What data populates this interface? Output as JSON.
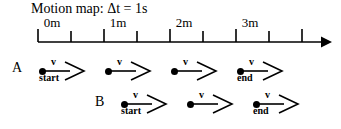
{
  "diagram": {
    "title": "Motion map: Δt = 1s",
    "axis": {
      "start_x": 38,
      "end_x": 332,
      "y": 42,
      "tick_spacing": 33,
      "tick_count": 9,
      "tick_height_major": 13,
      "tick_height_minor": 11,
      "arrowhead": "solid-right-triangle",
      "color": "#000000"
    },
    "tick_labels": [
      {
        "text": "0m",
        "x": 52
      },
      {
        "text": "1m",
        "x": 118
      },
      {
        "text": "2m",
        "x": 184
      },
      {
        "text": "3m",
        "x": 250
      }
    ],
    "objects": [
      {
        "name": "A",
        "letter": "A",
        "letter_x": 12,
        "letter_y": 60,
        "row_y": 71,
        "markers": [
          {
            "x": 42,
            "label_v": "v",
            "label_below": "start"
          },
          {
            "x": 108,
            "label_v": "v",
            "label_below": ""
          },
          {
            "x": 174,
            "label_v": "v",
            "label_below": ""
          },
          {
            "x": 240,
            "label_v": "v",
            "label_below": "end"
          }
        ]
      },
      {
        "name": "B",
        "letter": "B",
        "letter_x": 95,
        "letter_y": 94,
        "row_y": 104,
        "markers": [
          {
            "x": 124,
            "label_v": "v",
            "label_below": "start"
          },
          {
            "x": 190,
            "label_v": "v",
            "label_below": ""
          },
          {
            "x": 256,
            "label_v": "v",
            "label_below": "end"
          }
        ]
      }
    ],
    "arrow": {
      "shaft_length": 26,
      "head_length": 14,
      "head_half_height": 9,
      "stroke_width": 1.6,
      "style": "open-v-head"
    }
  }
}
